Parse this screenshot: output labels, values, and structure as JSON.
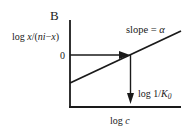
{
  "panel_label": "B",
  "y_axis_label": "log x/(ni−x)",
  "y_axis_label_parts": {
    "prefix": "log ",
    "italic": "x",
    "mid": "/(",
    "italic2": "ni",
    "dash": "−",
    "italic3": "x",
    "suffix": ")"
  },
  "y_tick_zero": "0",
  "x_axis_label": "log c",
  "x_axis_label_parts": {
    "prefix": "log ",
    "italic": "c"
  },
  "slope_label": "slope = α",
  "slope_label_parts": {
    "text": "slope = ",
    "symbol": "α"
  },
  "intercept_label": "log 1/K0",
  "intercept_label_parts": {
    "text": "log 1/",
    "italic": "K",
    "subscript": "0"
  },
  "colors": {
    "ink": "#1a1a1a",
    "background": "#ffffff"
  }
}
